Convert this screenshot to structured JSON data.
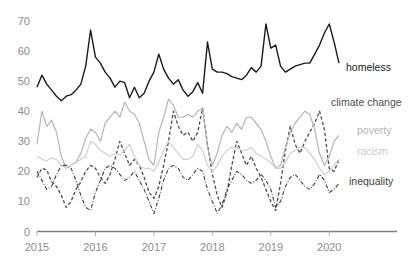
{
  "chart_data": {
    "type": "line",
    "title": "",
    "xlabel": "",
    "ylabel": "",
    "ylim": [
      0,
      72
    ],
    "yticks": [
      0,
      10,
      20,
      30,
      40,
      50,
      60,
      70
    ],
    "ytick_labels": [
      "0",
      "10",
      "20",
      "30",
      "40",
      "50",
      "60",
      "70"
    ],
    "xlim": [
      "2015-01",
      "2020-04"
    ],
    "xticks": [
      "2015",
      "2016",
      "2017",
      "2018",
      "2019",
      "2020"
    ],
    "xtick_labels": [
      "2015",
      "2016",
      "2017",
      "2018",
      "2019",
      "2020"
    ],
    "grid": false,
    "legend_position": "right-inline",
    "x": [
      "2015-01",
      "2015-02",
      "2015-03",
      "2015-04",
      "2015-05",
      "2015-06",
      "2015-07",
      "2015-08",
      "2015-09",
      "2015-10",
      "2015-11",
      "2015-12",
      "2016-01",
      "2016-02",
      "2016-03",
      "2016-04",
      "2016-05",
      "2016-06",
      "2016-07",
      "2016-08",
      "2016-09",
      "2016-10",
      "2016-11",
      "2016-12",
      "2017-01",
      "2017-02",
      "2017-03",
      "2017-04",
      "2017-05",
      "2017-06",
      "2017-07",
      "2017-08",
      "2017-09",
      "2017-10",
      "2017-11",
      "2017-12",
      "2018-01",
      "2018-02",
      "2018-03",
      "2018-04",
      "2018-05",
      "2018-06",
      "2018-07",
      "2018-08",
      "2018-09",
      "2018-10",
      "2018-11",
      "2018-12",
      "2019-01",
      "2019-02",
      "2019-03",
      "2019-04",
      "2019-05",
      "2019-06",
      "2019-07",
      "2019-08",
      "2019-09",
      "2019-10",
      "2019-11",
      "2019-12",
      "2020-01",
      "2020-02",
      "2020-03"
    ],
    "series": [
      {
        "name": "homeless",
        "color": "#1a1a1a",
        "linestyle": "solid",
        "linewidth": 1.4,
        "label": "homeless",
        "values": [
          48,
          52,
          49,
          47,
          45,
          43.5,
          45,
          45.5,
          47,
          49,
          55,
          67,
          58,
          56,
          53,
          51,
          48,
          50,
          49.5,
          44.5,
          48,
          44.5,
          46,
          50,
          53,
          59,
          54,
          51,
          49,
          50.5,
          47,
          45,
          46.5,
          49.5,
          46,
          63,
          54,
          53,
          53,
          52.5,
          51.5,
          51,
          50.5,
          52,
          54.5,
          53,
          55,
          69,
          61,
          62,
          55,
          53,
          54,
          55,
          55.5,
          56,
          56,
          59,
          62,
          66,
          69,
          63,
          56
        ]
      },
      {
        "name": "climate change",
        "color": "#4d4d4d",
        "linestyle": "dashed",
        "linewidth": 1.3,
        "label": "climate change",
        "values": [
          18,
          21,
          20.5,
          16.5,
          15,
          12,
          8,
          10,
          14,
          16.5,
          20,
          22,
          21,
          18,
          16,
          19,
          24,
          30,
          26,
          22,
          24,
          22,
          18,
          13,
          11,
          15,
          22,
          30,
          40,
          35,
          32,
          33,
          30,
          33,
          41,
          29,
          19,
          12,
          8,
          13,
          22,
          30,
          26,
          22,
          25,
          21,
          18,
          14,
          10,
          7,
          16,
          27,
          35,
          29,
          26,
          30,
          33,
          36,
          40,
          34,
          21,
          20,
          24
        ]
      },
      {
        "name": "poverty",
        "color": "#b5b5b5",
        "linestyle": "solid",
        "linewidth": 1.2,
        "label": "poverty",
        "values": [
          29,
          40,
          35,
          37,
          33,
          25,
          21,
          22,
          23,
          26,
          31,
          34,
          33,
          30,
          36,
          38,
          40,
          38,
          43,
          40,
          39,
          36,
          30,
          24,
          22,
          33,
          38,
          44,
          42,
          38,
          38,
          39,
          38,
          40,
          41,
          28,
          22,
          26,
          32,
          35,
          33,
          36,
          34,
          38,
          38,
          36,
          34,
          30,
          25,
          21,
          22,
          28,
          33,
          36,
          38,
          40,
          39,
          34,
          26,
          22,
          25,
          30,
          32
        ]
      },
      {
        "name": "racism",
        "color": "#cfcfcf",
        "linestyle": "solid",
        "linewidth": 1.2,
        "label": "racism",
        "values": [
          25,
          24,
          23.5,
          24.5,
          24,
          22,
          21,
          22,
          23,
          24,
          25,
          30,
          29,
          27,
          26,
          25,
          26,
          25.5,
          27,
          29,
          25,
          22,
          21,
          21,
          20,
          23,
          27,
          30,
          28,
          26,
          24,
          24,
          25,
          29,
          27,
          22,
          20,
          22,
          25,
          27,
          28,
          28,
          27,
          27,
          28,
          26,
          25,
          24,
          23,
          21,
          21,
          23,
          26,
          27,
          28,
          28,
          26,
          24,
          21,
          19,
          20,
          22,
          24
        ]
      },
      {
        "name": "inequality",
        "color": "#3d3d3d",
        "linestyle": "dashdot",
        "linewidth": 1.1,
        "label": "inequality",
        "values": [
          20,
          17,
          14,
          15,
          19,
          22,
          22,
          21,
          17,
          12,
          8,
          7,
          13,
          17,
          21,
          22,
          21,
          19,
          17,
          18,
          20,
          17,
          14,
          10,
          6,
          11,
          17,
          21,
          22,
          21,
          18,
          17,
          19,
          21,
          20,
          14,
          10,
          6,
          9,
          14,
          17,
          20,
          19,
          17,
          16,
          17,
          19,
          17,
          14,
          8,
          10,
          15,
          18,
          19,
          17,
          15,
          14,
          16,
          19,
          17,
          13,
          14,
          16
        ]
      }
    ]
  },
  "axis": {
    "x_axis_color": "#808080",
    "tick_color": "#b0b0b0",
    "label_color": "#8c8c8c"
  }
}
